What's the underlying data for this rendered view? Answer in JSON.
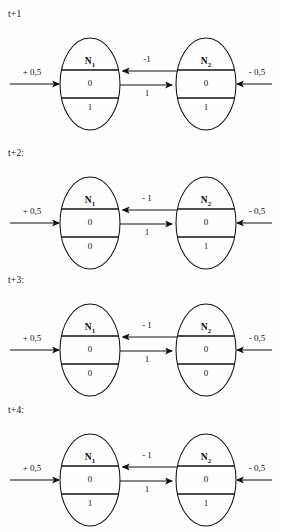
{
  "figure": {
    "type": "state-evolution-diagram",
    "ink_color": "#141110",
    "paper_color": "#fefefe"
  },
  "labels": {
    "node1_name": "N",
    "node1_sub": "1",
    "node2_name": "N",
    "node2_sub": "2",
    "input_left": "+ 0,5",
    "input_right": "- 0,5",
    "edge_top": "- 1",
    "edge_bottom": "1"
  },
  "steps": [
    {
      "step_label": "t+1",
      "top": 4,
      "node1": {
        "name": "N",
        "sub": "1",
        "mid": "0",
        "bottom": "1"
      },
      "node2": {
        "name": "N",
        "sub": "2",
        "mid": "0",
        "bottom": "1"
      },
      "edge_top": "-1",
      "edge_bottom": "1",
      "input_left": "+ 0,5",
      "input_right": "- 0,5"
    },
    {
      "step_label": "t+2:",
      "top": 143,
      "node1": {
        "name": "N",
        "sub": "1",
        "mid": "0",
        "bottom": "0"
      },
      "node2": {
        "name": "N",
        "sub": "2",
        "mid": "0",
        "bottom": "1"
      },
      "edge_top": "- 1",
      "edge_bottom": "1",
      "input_left": "+ 0,5",
      "input_right": "- 0,5"
    },
    {
      "step_label": "t+3:",
      "top": 270,
      "node1": {
        "name": "N",
        "sub": "1",
        "mid": "0",
        "bottom": "0"
      },
      "node2": {
        "name": "N",
        "sub": "2",
        "mid": "0",
        "bottom": "0"
      },
      "edge_top": "- 1",
      "edge_bottom": "1",
      "input_left": "+ 0,5",
      "input_right": "- 0,5"
    },
    {
      "step_label": "t+4:",
      "top": 400,
      "node1": {
        "name": "N",
        "sub": "1",
        "mid": "0",
        "bottom": "1"
      },
      "node2": {
        "name": "N",
        "sub": "2",
        "mid": "0",
        "bottom": "1"
      },
      "edge_top": "- 1",
      "edge_bottom": "1",
      "input_left": "+ 0,5",
      "input_right": "- 0,5"
    }
  ]
}
